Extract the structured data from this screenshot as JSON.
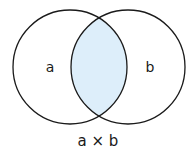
{
  "diagram": {
    "type": "venn",
    "sets": [
      {
        "label": "a",
        "cx": 70,
        "cy": 67,
        "r": 57
      },
      {
        "label": "b",
        "cx": 128,
        "cy": 67,
        "r": 57
      }
    ],
    "intersection_fill": "#ddeefa",
    "stroke_color": "#1a1a1a",
    "caption": "a × b"
  }
}
